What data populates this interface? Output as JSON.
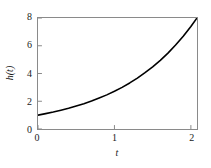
{
  "chart_data": {
    "type": "line",
    "title": "",
    "xlabel": "t",
    "ylabel": "h(t)",
    "xlim": [
      0,
      2.08
    ],
    "ylim": [
      0,
      8
    ],
    "xticks": [
      0,
      1,
      2
    ],
    "xticklabels": [
      "0",
      "1",
      "2"
    ],
    "yticks": [
      0,
      2,
      4,
      6,
      8
    ],
    "yticklabels": [
      "0",
      "2",
      "4",
      "6",
      "8"
    ],
    "grid": false,
    "legend": null,
    "line_color": "#000000",
    "frame_color": "#8a8a8a",
    "background_color": "#ffffff",
    "series": [
      {
        "name": "h(t)",
        "x": [
          0.0,
          0.1,
          0.2,
          0.3,
          0.4,
          0.5,
          0.6,
          0.7,
          0.8,
          0.9,
          1.0,
          1.1,
          1.2,
          1.3,
          1.4,
          1.5,
          1.6,
          1.7,
          1.8,
          1.9,
          2.0,
          2.08
        ],
        "y": [
          1.0,
          1.11,
          1.22,
          1.35,
          1.49,
          1.65,
          1.82,
          2.01,
          2.23,
          2.46,
          2.72,
          3.0,
          3.32,
          3.67,
          4.06,
          4.48,
          4.95,
          5.47,
          6.05,
          6.69,
          7.39,
          8.0
        ]
      }
    ]
  }
}
